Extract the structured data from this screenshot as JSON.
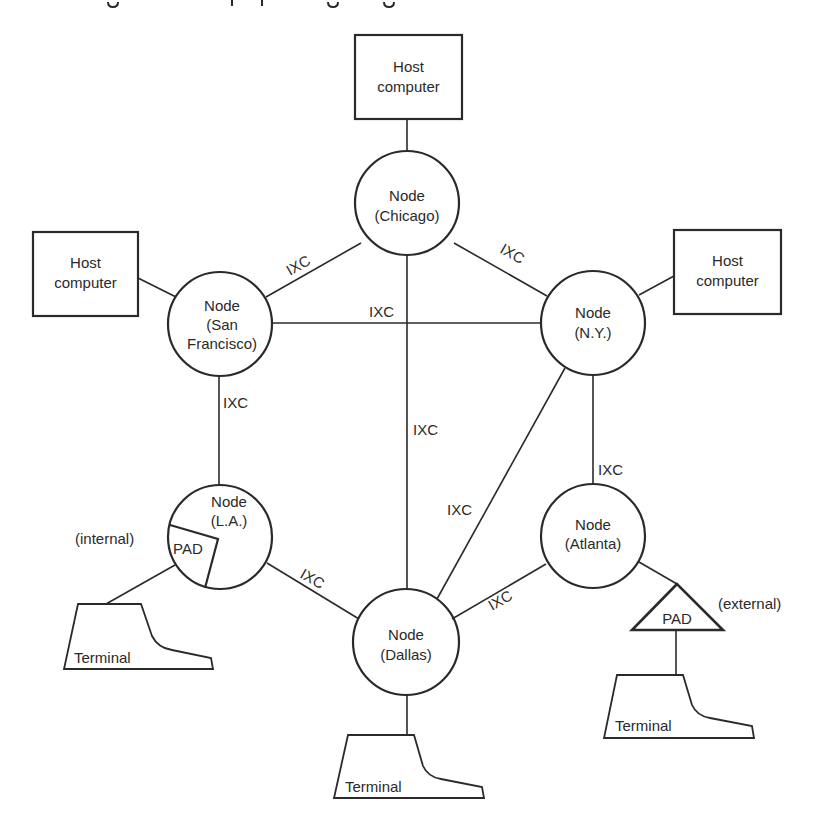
{
  "diagram": {
    "caption_visible": false,
    "colors": {
      "ink": "#2a2a2a",
      "background": "#ffffff"
    },
    "hosts": [
      {
        "id": "host-top",
        "line1": "Host",
        "line2": "computer",
        "x": 355,
        "y": 35,
        "w": 107,
        "h": 84
      },
      {
        "id": "host-left",
        "line1": "Host",
        "line2": "computer",
        "x": 33,
        "y": 232,
        "w": 105,
        "h": 84
      },
      {
        "id": "host-right",
        "line1": "Host",
        "line2": "computer",
        "x": 674,
        "y": 230,
        "w": 107,
        "h": 84
      }
    ],
    "nodes": [
      {
        "id": "chicago",
        "line1": "Node",
        "line2": "(Chicago)",
        "line3": "",
        "cx": 407,
        "cy": 203,
        "r": 52
      },
      {
        "id": "san-francisco",
        "line1": "Node",
        "line2": "(San",
        "line3": "Francisco)",
        "cx": 220,
        "cy": 324,
        "r": 52
      },
      {
        "id": "ny",
        "line1": "Node",
        "line2": "(N.Y.)",
        "line3": "",
        "cx": 593,
        "cy": 323,
        "r": 52
      },
      {
        "id": "la",
        "line1": "Node",
        "line2": "(L.A.)",
        "line3": "",
        "cx": 220,
        "cy": 537,
        "r": 52
      },
      {
        "id": "atlanta",
        "line1": "Node",
        "line2": "(Atlanta)",
        "line3": "",
        "cx": 593,
        "cy": 536,
        "r": 52
      },
      {
        "id": "dallas",
        "line1": "Node",
        "line2": "(Dallas)",
        "line3": "",
        "cx": 406,
        "cy": 642,
        "r": 53
      }
    ],
    "links": [
      {
        "from": "Host computer (top)",
        "to": "Chicago",
        "label": ""
      },
      {
        "from": "Host computer (left)",
        "to": "San Francisco",
        "label": ""
      },
      {
        "from": "Host computer (right)",
        "to": "N.Y.",
        "label": ""
      },
      {
        "from": "San Francisco",
        "to": "Chicago",
        "label": "IXC"
      },
      {
        "from": "Chicago",
        "to": "N.Y.",
        "label": "IXC"
      },
      {
        "from": "San Francisco",
        "to": "N.Y.",
        "label": "IXC"
      },
      {
        "from": "Chicago",
        "to": "Dallas",
        "label": "IXC"
      },
      {
        "from": "San Francisco",
        "to": "L.A.",
        "label": "IXC"
      },
      {
        "from": "N.Y.",
        "to": "Atlanta",
        "label": "IXC"
      },
      {
        "from": "N.Y.",
        "to": "Dallas",
        "label": "IXC"
      },
      {
        "from": "L.A.",
        "to": "Dallas",
        "label": "IXC"
      },
      {
        "from": "Dallas",
        "to": "Atlanta",
        "label": "IXC"
      },
      {
        "from": "L.A.",
        "to": "Terminal (left)",
        "label": ""
      },
      {
        "from": "Dallas",
        "to": "Terminal (bottom)",
        "label": ""
      },
      {
        "from": "Atlanta",
        "to": "PAD (external)",
        "label": ""
      },
      {
        "from": "PAD (external)",
        "to": "Terminal (right)",
        "label": ""
      }
    ],
    "ixc_labels": {
      "sf_chicago": "IXC",
      "chicago_ny": "IXC",
      "sf_ny": "IXC",
      "chicago_dallas": "IXC",
      "sf_la": "IXC",
      "ny_atlanta": "IXC",
      "ny_dallas": "IXC",
      "la_dallas": "IXC",
      "dallas_atlanta": "IXC"
    },
    "pads": {
      "internal": {
        "label": "PAD",
        "annotation": "(internal)"
      },
      "external": {
        "label": "PAD",
        "annotation": "(external)"
      }
    },
    "terminals": [
      {
        "id": "terminal-left",
        "label": "Terminal"
      },
      {
        "id": "terminal-bottom",
        "label": "Terminal"
      },
      {
        "id": "terminal-right",
        "label": "Terminal"
      }
    ]
  }
}
